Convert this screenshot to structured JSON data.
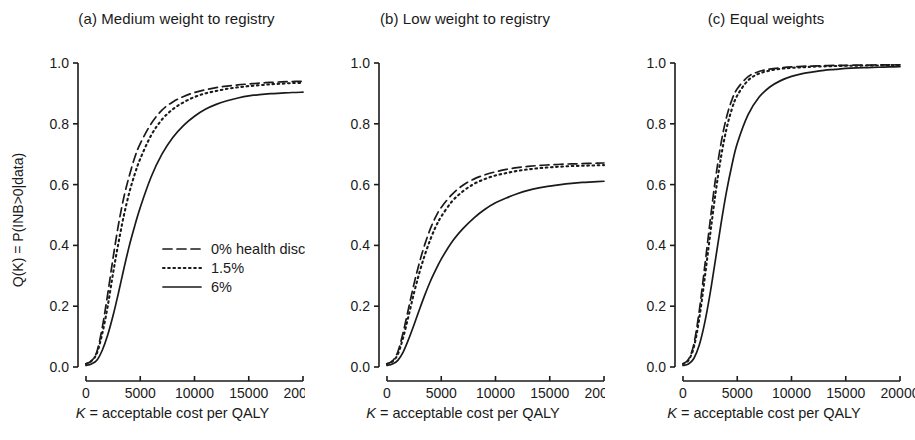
{
  "figure": {
    "axis_label_x": "K = acceptable cost per QALY",
    "axis_label_x_italic": "K",
    "axis_label_x_rest": " = acceptable cost per QALY",
    "axis_label_y": "Q(K) = P(INB>0|data)",
    "line_color": "#1a1a1a",
    "background": "#ffffff"
  },
  "legend": {
    "position": "inside-panel-a-lower-right",
    "entries": [
      {
        "label": "0% health discount",
        "style": "dashed"
      },
      {
        "label": "1.5%",
        "style": "dotted"
      },
      {
        "label": "6%",
        "style": "solid"
      }
    ]
  },
  "chart_data": [
    {
      "type": "line",
      "title": "(a) Medium weight to registry",
      "xlabel": "K = acceptable cost per QALY",
      "ylabel": "Q(K) = P(INB>0|data)",
      "xlim": [
        0,
        20000
      ],
      "ylim": [
        0,
        1.0
      ],
      "xticks": [
        0,
        5000,
        10000,
        15000,
        20000
      ],
      "xticklabels": [
        "0",
        "5000",
        "10000",
        "15000",
        "20000"
      ],
      "yticks": [
        0.0,
        0.2,
        0.4,
        0.6,
        0.8,
        1.0
      ],
      "yticklabels": [
        "0.0",
        "0.2",
        "0.4",
        "0.6",
        "0.8",
        "1.0"
      ],
      "grid": false,
      "x": [
        0,
        500,
        1000,
        1500,
        2000,
        2500,
        3000,
        3500,
        4000,
        4500,
        5000,
        6000,
        7000,
        8000,
        9000,
        10000,
        11000,
        12000,
        13000,
        14000,
        15000,
        16000,
        17000,
        18000,
        19000,
        20000
      ],
      "series": [
        {
          "name": "0% health discount",
          "style": "dashed",
          "values": [
            0.01,
            0.02,
            0.05,
            0.13,
            0.24,
            0.36,
            0.47,
            0.56,
            0.63,
            0.69,
            0.735,
            0.8,
            0.845,
            0.872,
            0.89,
            0.903,
            0.912,
            0.919,
            0.924,
            0.928,
            0.931,
            0.934,
            0.936,
            0.938,
            0.939,
            0.94
          ]
        },
        {
          "name": "1.5%",
          "style": "dotted",
          "values": [
            0.01,
            0.02,
            0.045,
            0.11,
            0.2,
            0.31,
            0.41,
            0.5,
            0.575,
            0.635,
            0.685,
            0.762,
            0.814,
            0.848,
            0.871,
            0.888,
            0.9,
            0.908,
            0.915,
            0.92,
            0.924,
            0.927,
            0.93,
            0.932,
            0.934,
            0.935
          ]
        },
        {
          "name": "6%",
          "style": "solid",
          "values": [
            0.005,
            0.01,
            0.022,
            0.055,
            0.105,
            0.17,
            0.245,
            0.325,
            0.4,
            0.465,
            0.525,
            0.625,
            0.7,
            0.755,
            0.795,
            0.825,
            0.848,
            0.864,
            0.876,
            0.885,
            0.892,
            0.896,
            0.899,
            0.901,
            0.903,
            0.904
          ]
        }
      ]
    },
    {
      "type": "line",
      "title": "(b) Low weight to registry",
      "xlabel": "K = acceptable cost per QALY",
      "ylabel": "Q(K) = P(INB>0|data)",
      "xlim": [
        0,
        20000
      ],
      "ylim": [
        0,
        1.0
      ],
      "xticks": [
        0,
        5000,
        10000,
        15000,
        20000
      ],
      "xticklabels": [
        "0",
        "5000",
        "10000",
        "15000",
        "20000"
      ],
      "yticks": [
        0.0,
        0.2,
        0.4,
        0.6,
        0.8,
        1.0
      ],
      "yticklabels": [
        "0.0",
        "0.2",
        "0.4",
        "0.6",
        "0.8",
        "1.0"
      ],
      "grid": false,
      "x": [
        0,
        500,
        1000,
        1500,
        2000,
        2500,
        3000,
        3500,
        4000,
        4500,
        5000,
        6000,
        7000,
        8000,
        9000,
        10000,
        11000,
        12000,
        13000,
        14000,
        15000,
        16000,
        17000,
        18000,
        19000,
        20000
      ],
      "series": [
        {
          "name": "0% health discount",
          "style": "dashed",
          "values": [
            0.01,
            0.02,
            0.05,
            0.115,
            0.195,
            0.275,
            0.345,
            0.405,
            0.455,
            0.495,
            0.525,
            0.568,
            0.598,
            0.618,
            0.632,
            0.642,
            0.65,
            0.656,
            0.66,
            0.663,
            0.665,
            0.667,
            0.668,
            0.669,
            0.67,
            0.671
          ]
        },
        {
          "name": "1.5%",
          "style": "dotted",
          "values": [
            0.01,
            0.018,
            0.042,
            0.098,
            0.17,
            0.245,
            0.312,
            0.37,
            0.42,
            0.462,
            0.495,
            0.545,
            0.578,
            0.602,
            0.618,
            0.63,
            0.638,
            0.645,
            0.65,
            0.654,
            0.657,
            0.659,
            0.661,
            0.662,
            0.663,
            0.664
          ]
        },
        {
          "name": "6%",
          "style": "solid",
          "values": [
            0.005,
            0.01,
            0.022,
            0.05,
            0.092,
            0.14,
            0.19,
            0.238,
            0.282,
            0.32,
            0.355,
            0.412,
            0.455,
            0.49,
            0.518,
            0.54,
            0.556,
            0.57,
            0.581,
            0.589,
            0.595,
            0.6,
            0.604,
            0.607,
            0.609,
            0.611
          ]
        }
      ]
    },
    {
      "type": "line",
      "title": "(c) Equal weights",
      "xlabel": "K = acceptable cost per QALY",
      "ylabel": "Q(K) = P(INB>0|data)",
      "xlim": [
        0,
        20000
      ],
      "ylim": [
        0,
        1.0
      ],
      "xticks": [
        0,
        5000,
        10000,
        15000,
        20000
      ],
      "xticklabels": [
        "0",
        "5000",
        "10000",
        "15000",
        "20000"
      ],
      "yticks": [
        0.0,
        0.2,
        0.4,
        0.6,
        0.8,
        1.0
      ],
      "yticklabels": [
        "0.0",
        "0.2",
        "0.4",
        "0.6",
        "0.8",
        "1.0"
      ],
      "grid": false,
      "x": [
        0,
        500,
        1000,
        1500,
        2000,
        2500,
        3000,
        3500,
        4000,
        4500,
        5000,
        6000,
        7000,
        8000,
        9000,
        10000,
        11000,
        12000,
        13000,
        14000,
        15000,
        16000,
        17000,
        18000,
        19000,
        20000
      ],
      "series": [
        {
          "name": "0% health discount",
          "style": "dashed",
          "values": [
            0.01,
            0.025,
            0.075,
            0.185,
            0.33,
            0.48,
            0.62,
            0.735,
            0.82,
            0.878,
            0.915,
            0.955,
            0.972,
            0.98,
            0.984,
            0.987,
            0.989,
            0.99,
            0.991,
            0.992,
            0.992,
            0.993,
            0.993,
            0.994,
            0.994,
            0.994
          ]
        },
        {
          "name": "1.5%",
          "style": "dotted",
          "values": [
            0.01,
            0.022,
            0.065,
            0.16,
            0.292,
            0.435,
            0.572,
            0.69,
            0.782,
            0.848,
            0.893,
            0.943,
            0.965,
            0.975,
            0.981,
            0.984,
            0.986,
            0.988,
            0.989,
            0.99,
            0.991,
            0.991,
            0.992,
            0.992,
            0.993,
            0.993
          ]
        },
        {
          "name": "6%",
          "style": "solid",
          "values": [
            0.005,
            0.01,
            0.028,
            0.072,
            0.145,
            0.242,
            0.355,
            0.47,
            0.575,
            0.663,
            0.735,
            0.83,
            0.887,
            0.921,
            0.942,
            0.956,
            0.965,
            0.971,
            0.976,
            0.979,
            0.982,
            0.984,
            0.985,
            0.986,
            0.987,
            0.988
          ]
        }
      ]
    }
  ]
}
